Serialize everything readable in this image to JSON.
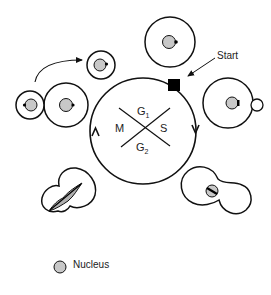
{
  "diagram": {
    "phases": {
      "g1": "G",
      "g1_sub": "1",
      "s": "S",
      "g2": "G",
      "g2_sub": "2",
      "m": "M"
    },
    "start_label": "Start",
    "legend": {
      "nucleus_label": "Nucleus"
    },
    "colors": {
      "stroke": "#111111",
      "nucleus_fill": "#c8c8c8",
      "start_marker": "#000000",
      "background": "#ffffff"
    }
  }
}
